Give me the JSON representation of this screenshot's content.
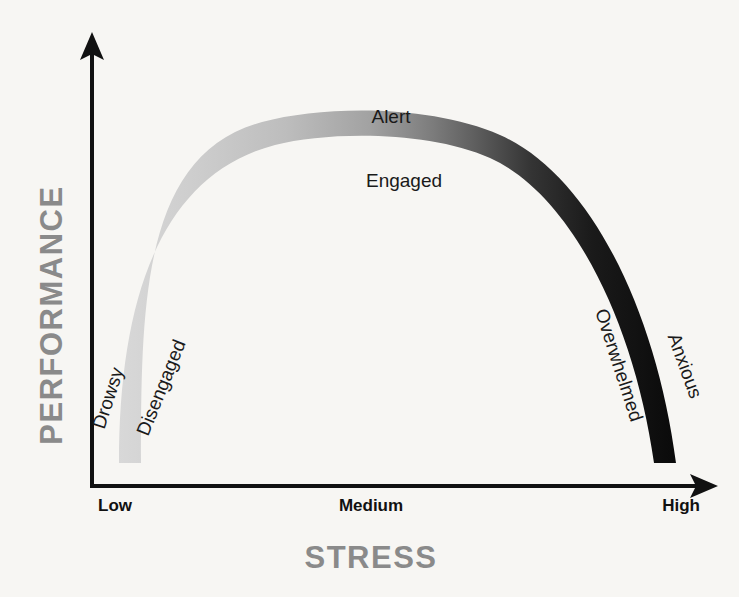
{
  "figure": {
    "background_color": "#f7f6f3",
    "axis_color": "#111111",
    "title": ""
  },
  "axes": {
    "y_title": "PERFORMANCE",
    "x_title": "STRESS",
    "title_color": "#8a8a8a",
    "x_ticks": [
      {
        "label": "Low",
        "position": "left"
      },
      {
        "label": "Medium",
        "position": "center"
      },
      {
        "label": "High",
        "position": "right"
      }
    ]
  },
  "zones": [
    {
      "label": "Drowsy",
      "color": "#d2d2d2",
      "side": "outer-left",
      "rotation": -72
    },
    {
      "label": "Disengaged",
      "color": "#c4c4c4",
      "side": "inner-left",
      "rotation": -68
    },
    {
      "label": "Alert",
      "color": "#6f6f6f",
      "side": "above-apex",
      "rotation": 0
    },
    {
      "label": "Engaged",
      "color": "#6f6f6f",
      "side": "below-apex",
      "rotation": 0
    },
    {
      "label": "Overwhelmed",
      "color": "#242424",
      "side": "inner-right",
      "rotation": 72
    },
    {
      "label": "Anxious",
      "color": "#101010",
      "side": "outer-right",
      "rotation": 70
    }
  ],
  "gradient": {
    "stops": [
      {
        "offset": "0%",
        "color": "#d8d8d8"
      },
      {
        "offset": "14%",
        "color": "#cdcdcd"
      },
      {
        "offset": "30%",
        "color": "#bdbdbd"
      },
      {
        "offset": "45%",
        "color": "#a2a2a2"
      },
      {
        "offset": "56%",
        "color": "#7d7d7d"
      },
      {
        "offset": "64%",
        "color": "#5e5e5e"
      },
      {
        "offset": "74%",
        "color": "#343434"
      },
      {
        "offset": "85%",
        "color": "#1a1a1a"
      },
      {
        "offset": "100%",
        "color": "#0a0a0a"
      }
    ]
  },
  "chart_data": {
    "type": "line",
    "xlabel": "STRESS",
    "ylabel": "PERFORMANCE",
    "xlim": [
      0,
      100
    ],
    "ylim": [
      0,
      100
    ],
    "grid": false,
    "legend": "none",
    "x_tick_labels": [
      "Low",
      "Medium",
      "High"
    ],
    "x_tick_values": [
      0,
      50,
      100
    ],
    "y_tick_labels": [],
    "annotations": [
      {
        "text": "Drowsy",
        "x": 3,
        "y": 18
      },
      {
        "text": "Disengaged",
        "x": 11,
        "y": 24
      },
      {
        "text": "Alert",
        "x": 48,
        "y": 97
      },
      {
        "text": "Engaged",
        "x": 53,
        "y": 83
      },
      {
        "text": "Overwhelmed",
        "x": 89,
        "y": 31
      },
      {
        "text": "Anxious",
        "x": 97,
        "y": 26
      }
    ],
    "series": [
      {
        "name": "Performance vs Stress",
        "x": [
          2,
          6,
          12,
          20,
          30,
          40,
          50,
          60,
          70,
          80,
          88,
          94,
          98
        ],
        "y": [
          4,
          22,
          45,
          64,
          80,
          90,
          94,
          92,
          84,
          68,
          48,
          26,
          6
        ]
      }
    ]
  }
}
